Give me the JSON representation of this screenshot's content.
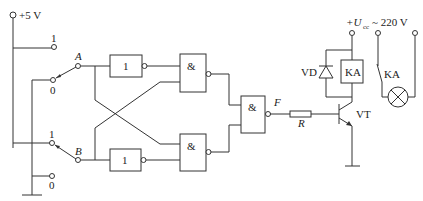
{
  "diagram": {
    "type": "circuit-schematic",
    "supply": {
      "label": "+5 V"
    },
    "switch_a": {
      "name": "A",
      "pos_high": "1",
      "pos_low": "0"
    },
    "switch_b": {
      "name": "B",
      "pos_high": "1",
      "pos_low": "0"
    },
    "gates": {
      "not_a": "1",
      "not_b": "1",
      "nand_top": "&",
      "nand_bottom": "&",
      "nand_out": "&"
    },
    "output_label": "F",
    "resistor_label": "R",
    "transistor_label": "VT",
    "diode_label": "VD",
    "relay_coil_label": "KA",
    "relay_contact_label": "KA",
    "ucc": {
      "prefix": "+U",
      "sub": "cc",
      "suffix": "~ 220 V"
    }
  }
}
